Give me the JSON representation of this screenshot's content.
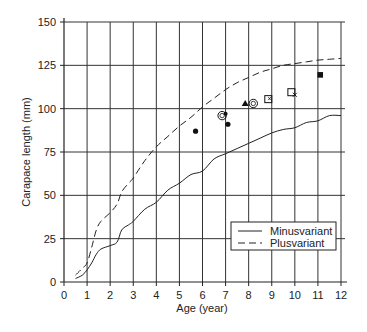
{
  "chart_data": {
    "type": "line",
    "title": "",
    "xlabel": "Age (year)",
    "ylabel": "Carapace length (mm)",
    "xlim": [
      0,
      12
    ],
    "ylim": [
      0,
      150
    ],
    "xticks": [
      0,
      1,
      2,
      3,
      4,
      5,
      6,
      7,
      8,
      9,
      10,
      11,
      12
    ],
    "yticks": [
      0,
      25,
      50,
      75,
      100,
      125,
      150
    ],
    "grid": true,
    "legend_position": "lower right",
    "series": [
      {
        "name": "Minusvariant",
        "style": "solid",
        "x": [
          0.5,
          0.8,
          1,
          1.2,
          1.4,
          1.6,
          2,
          2.3,
          2.5,
          2.8,
          3,
          3.5,
          4,
          4.5,
          5,
          5.5,
          6,
          6.5,
          7,
          7.5,
          8,
          8.5,
          9,
          9.5,
          10,
          10.5,
          11,
          11.5,
          12
        ],
        "y": [
          2,
          4,
          7,
          11,
          16,
          19,
          21,
          23,
          30,
          33,
          35,
          42,
          46,
          53,
          57,
          62,
          64,
          71,
          74,
          77,
          80,
          83,
          86,
          88,
          89,
          92,
          93,
          96,
          96
        ]
      },
      {
        "name": "Plusvariant",
        "style": "dashed",
        "x": [
          0.5,
          0.8,
          1,
          1.2,
          1.4,
          1.6,
          2,
          2.3,
          2.5,
          2.8,
          3,
          3.5,
          4,
          4.5,
          5,
          5.5,
          6,
          6.5,
          7,
          7.5,
          8,
          8.5,
          9,
          9.5,
          10,
          10.5,
          11,
          11.5,
          12
        ],
        "y": [
          4,
          8,
          11,
          20,
          30,
          35,
          40,
          45,
          52,
          57,
          60,
          70,
          78,
          84,
          90,
          95,
          101,
          106,
          111,
          115,
          118,
          121,
          123,
          125,
          126,
          127,
          128,
          128.5,
          129
        ]
      }
    ],
    "points": [
      {
        "x": 5.7,
        "y": 87,
        "marker": "filled-circle"
      },
      {
        "x": 6.85,
        "y": 96,
        "marker": "open-circle"
      },
      {
        "x": 7.0,
        "y": 97,
        "marker": "filled-circle-small"
      },
      {
        "x": 7.1,
        "y": 91,
        "marker": "filled-circle"
      },
      {
        "x": 7.85,
        "y": 103,
        "marker": "filled-triangle"
      },
      {
        "x": 8.2,
        "y": 103,
        "marker": "open-circle"
      },
      {
        "x": 8.85,
        "y": 105.5,
        "marker": "open-square-x"
      },
      {
        "x": 9.85,
        "y": 109.5,
        "marker": "open-square"
      },
      {
        "x": 10.0,
        "y": 108,
        "marker": "x"
      },
      {
        "x": 11.1,
        "y": 119.5,
        "marker": "filled-square"
      }
    ]
  },
  "legend": {
    "items": [
      {
        "label": "Minusvariant",
        "style": "solid"
      },
      {
        "label": "Plusvariant",
        "style": "dashed"
      }
    ]
  },
  "layout": {
    "plot": {
      "x0": 64,
      "x1": 341,
      "y0": 282,
      "y1": 22
    },
    "axis_color": "#222222",
    "grid_color": "#333333",
    "line_color": "#222222"
  }
}
